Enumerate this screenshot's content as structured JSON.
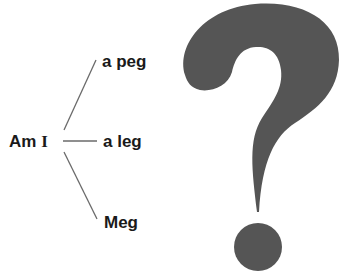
{
  "diagram": {
    "type": "tree",
    "root": {
      "label_prefix": "Am ",
      "label_suffix": "I"
    },
    "branches": [
      {
        "label": "a peg"
      },
      {
        "label": "a leg"
      },
      {
        "label": "Meg"
      }
    ],
    "decoration": {
      "icon": "question-mark-icon",
      "color": "#555555"
    },
    "colors": {
      "text": "#1a1a1a",
      "lines": "#6a6a6a",
      "question_mark": "#555555",
      "background": "#ffffff"
    }
  }
}
